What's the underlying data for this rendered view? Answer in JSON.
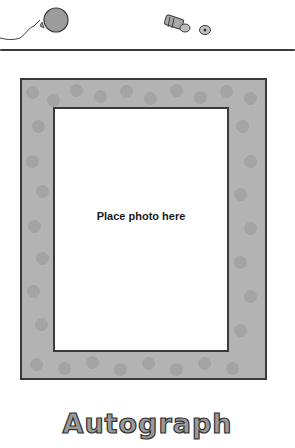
{
  "decorations": {
    "icons": [
      "balloon-icon",
      "party-horn-icon",
      "confetti-icon"
    ],
    "colors": {
      "frame_fill": "#b3b3b3",
      "frame_dots": "#a4a4a4",
      "outline": "#3a3a3a",
      "balloon": "#9c9c9c"
    }
  },
  "photo_frame": {
    "placeholder_text": "Place photo here"
  },
  "footer": {
    "title": "Autograph"
  }
}
